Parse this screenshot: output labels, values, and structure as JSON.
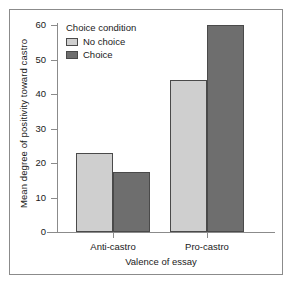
{
  "chart_data": {
    "type": "bar",
    "title": "",
    "categories": [
      "Anti-castro",
      "Pro-castro"
    ],
    "series": [
      {
        "name": "No choice",
        "values": [
          23,
          44
        ],
        "color": "#cfcfcf"
      },
      {
        "name": "Choice",
        "values": [
          17.5,
          60
        ],
        "color": "#6e6e6e"
      }
    ],
    "xlabel": "Valence of essay",
    "ylabel": "Mean degree of positivity toward castro",
    "ylim": [
      0,
      63
    ],
    "yticks": [
      0,
      10,
      20,
      30,
      40,
      50,
      60
    ],
    "ytick_labels": [
      "0",
      "10",
      "20",
      "30",
      "40",
      "50",
      "60"
    ],
    "grid": false,
    "legend": {
      "title": "Choice condition",
      "position": "top-left-inside",
      "entries": [
        "No choice",
        "Choice"
      ]
    }
  },
  "colors": {
    "no_choice": "#cfcfcf",
    "choice": "#6e6e6e",
    "bar_border": "#4a4a4a",
    "axis": "#8b8b8b",
    "frame": "#8b8b8b",
    "text": "#1a1a1a",
    "background": "#ffffff"
  }
}
